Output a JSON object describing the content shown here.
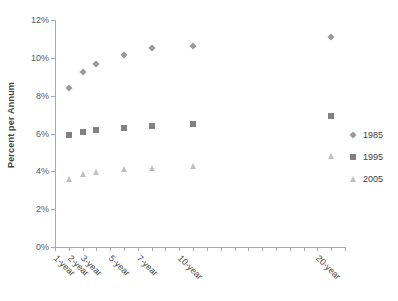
{
  "chart_data": {
    "type": "scatter",
    "title": "",
    "subtitle": "",
    "xlabel": "",
    "ylabel": "Percent per Annum",
    "categories": [
      "1-year",
      "2-year",
      "3-year",
      "5-year",
      "7-year",
      "10-year",
      "20-year"
    ],
    "x": [
      1,
      2,
      3,
      5,
      7,
      10,
      20
    ],
    "xlim": [
      0,
      21
    ],
    "ylim": [
      0,
      12
    ],
    "ytick_labels": [
      "0%",
      "2%",
      "4%",
      "6%",
      "8%",
      "10%",
      "12%"
    ],
    "ytick_values": [
      0,
      2,
      4,
      6,
      8,
      10,
      12
    ],
    "grid": false,
    "legend_position": "right",
    "series": [
      {
        "name": "1985",
        "marker": "diamond",
        "color": "#9a9a9a",
        "values": [
          8.4,
          9.25,
          9.65,
          10.15,
          10.5,
          10.65,
          11.1
        ]
      },
      {
        "name": "1995",
        "marker": "square",
        "color": "#808080",
        "values": [
          5.9,
          6.1,
          6.2,
          6.3,
          6.4,
          6.5,
          6.9
        ]
      },
      {
        "name": "2005",
        "marker": "triangle",
        "color": "#c0c0c0",
        "values": [
          3.6,
          3.85,
          3.95,
          4.1,
          4.2,
          4.3,
          4.8
        ]
      }
    ]
  },
  "axes": {
    "x_minor_tick_count": 21,
    "axis_color": "#a9a9a9"
  },
  "legend": {
    "items": [
      {
        "label": "1985",
        "marker": "diamond",
        "color": "#9a9a9a"
      },
      {
        "label": "1995",
        "marker": "square",
        "color": "#808080"
      },
      {
        "label": "2005",
        "marker": "triangle",
        "color": "#c0c0c0"
      }
    ]
  }
}
